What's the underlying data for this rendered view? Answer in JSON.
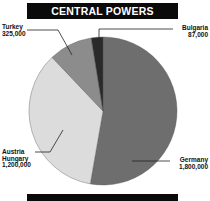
{
  "chart_data": {
    "type": "pie",
    "title": "CENTRAL POWERS",
    "categories": [
      "Germany",
      "Austria Hungary",
      "Turkey",
      "Bulgaria"
    ],
    "values": [
      1800000,
      1200000,
      325000,
      87000
    ],
    "colors": [
      "#6e6e6e",
      "#dcdcdc",
      "#8c8c8c",
      "#2a2a2a"
    ],
    "start_angle_deg": 0,
    "direction": "clockwise",
    "legend": "none (direct labels with leader lines)",
    "labels": [
      {
        "name_lines": [
          "Germany"
        ],
        "value": "1,800,000"
      },
      {
        "name_lines": [
          "Austria",
          "Hungary"
        ],
        "value": "1,200,000"
      },
      {
        "name_lines": [
          "Turkey"
        ],
        "value": "325,000"
      },
      {
        "name_lines": [
          "Bulgaria"
        ],
        "value": "87,000"
      }
    ]
  },
  "header": {
    "title": "CENTRAL POWERS"
  },
  "labels": {
    "germany": {
      "name": "Germany",
      "value": "1,800,000"
    },
    "austria": {
      "name1": "Austria",
      "name2": "Hungary",
      "value": "1,200,000"
    },
    "turkey": {
      "name": "Turkey",
      "value": "325,000"
    },
    "bulgaria": {
      "name": "Bulgaria",
      "value": "87,000"
    }
  }
}
